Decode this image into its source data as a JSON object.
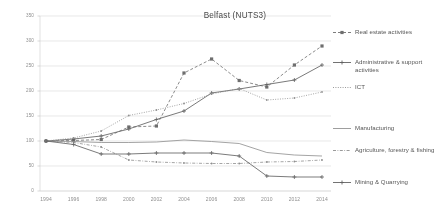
{
  "chart_data": {
    "type": "line",
    "title": "Belfast (NUTS3)",
    "xlabel": "",
    "ylabel": "",
    "x": [
      1994,
      1996,
      1998,
      2000,
      2002,
      2004,
      2006,
      2008,
      2010,
      2012,
      2014
    ],
    "xticklabels": [
      "1994",
      "1996",
      "1998",
      "2000",
      "2002",
      "2004",
      "2006",
      "2008",
      "2010",
      "2012",
      "2014"
    ],
    "ylim": [
      0,
      350
    ],
    "yticks": [
      0,
      50,
      100,
      150,
      200,
      250,
      300,
      350
    ],
    "yticklabels": [
      "0",
      "50",
      "100",
      "150",
      "200",
      "250",
      "300",
      "350"
    ],
    "grid": true,
    "legend_position": "right",
    "series": [
      {
        "name": "Real estate activities",
        "style": "dashed",
        "marker": "square",
        "color": "#666666",
        "values": [
          100,
          101,
          103,
          128,
          130,
          236,
          264,
          221,
          208,
          252,
          290
        ]
      },
      {
        "name": "Administrative & support activities",
        "style": "solid",
        "marker": "plus",
        "color": "#595959",
        "values": [
          100,
          104,
          110,
          124,
          143,
          160,
          196,
          204,
          213,
          222,
          252
        ]
      },
      {
        "name": "ICT",
        "style": "dotted",
        "marker": "dot",
        "color": "#8c8c8c",
        "values": [
          100,
          106,
          120,
          151,
          162,
          175,
          194,
          205,
          182,
          186,
          198
        ]
      },
      {
        "name": "Manufacturing",
        "style": "solid",
        "marker": "none",
        "color": "#909090",
        "values": [
          100,
          99,
          97,
          97,
          98,
          102,
          99,
          95,
          77,
          72,
          70
        ]
      },
      {
        "name": "Agriculture, forestry & fishing",
        "style": "dash-dot",
        "marker": "dot",
        "color": "#8a8a8a",
        "values": [
          100,
          97,
          88,
          62,
          58,
          56,
          55,
          55,
          58,
          59,
          62
        ]
      },
      {
        "name": "Mining & Quarrying",
        "style": "solid",
        "marker": "plus",
        "color": "#5a5a5a",
        "values": [
          100,
          93,
          74,
          74,
          76,
          76,
          76,
          70,
          30,
          28,
          28
        ]
      }
    ]
  },
  "legend": {
    "items": [
      {
        "label": "Real estate activities"
      },
      {
        "label": "Administrative & support activities"
      },
      {
        "label": "ICT"
      },
      {
        "label": "Manufacturing"
      },
      {
        "label": "Agriculture, forestry & fishing"
      },
      {
        "label": "Mining & Quarrying"
      }
    ]
  }
}
